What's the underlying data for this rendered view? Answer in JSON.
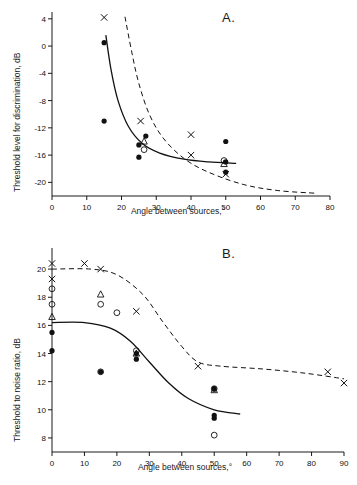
{
  "figure": {
    "panels": [
      {
        "label": "A."
      },
      {
        "label": "B."
      }
    ]
  },
  "chart_data": [
    {
      "type": "scatter",
      "panel": "A.",
      "title": "",
      "xlabel": "Angle between sources,°",
      "ylabel": "Threshold level for discrimination, dB",
      "xlim": [
        0,
        80
      ],
      "ylim": [
        -22,
        5
      ],
      "xticks": [
        0,
        10,
        20,
        30,
        40,
        50,
        60,
        70,
        80
      ],
      "yticks": [
        4,
        0,
        -4,
        -8,
        -12,
        -16,
        -20
      ],
      "xtick_labels": [
        "0",
        "10",
        "20",
        "30",
        "40",
        "50",
        "60",
        "70",
        "80"
      ],
      "ytick_labels": [
        "4",
        "0",
        "-4",
        "-8",
        "-12",
        "-16",
        "-20"
      ],
      "grid": false,
      "legend": "none",
      "series": [
        {
          "name": "filled circle",
          "marker": "filled-circle",
          "points": [
            {
              "x": 15.0,
              "y": 0.5
            },
            {
              "x": 15.0,
              "y": -11.0
            },
            {
              "x": 25.0,
              "y": -14.5
            },
            {
              "x": 25.0,
              "y": -16.3
            },
            {
              "x": 27.0,
              "y": -13.2
            },
            {
              "x": 50.0,
              "y": -14.0
            },
            {
              "x": 50.0,
              "y": -18.5
            },
            {
              "x": 50.0,
              "y": -17.0
            }
          ]
        },
        {
          "name": "open circle",
          "marker": "open-circle",
          "points": [
            {
              "x": 26.5,
              "y": -15.2
            },
            {
              "x": 49.5,
              "y": -16.8
            }
          ]
        },
        {
          "name": "open triangle",
          "marker": "open-triangle",
          "points": [
            {
              "x": 26.5,
              "y": -14.0
            },
            {
              "x": 49.5,
              "y": -17.3
            }
          ]
        },
        {
          "name": "cross",
          "marker": "cross",
          "points": [
            {
              "x": 15.0,
              "y": 4.2
            },
            {
              "x": 25.5,
              "y": -11.0
            },
            {
              "x": 40.0,
              "y": -16.0
            },
            {
              "x": 40.0,
              "y": -13.0
            },
            {
              "x": 50.0,
              "y": -18.8
            }
          ]
        }
      ],
      "curves": [
        {
          "name": "solid-curve",
          "style": "solid",
          "points": [
            {
              "x": 15.5,
              "y": 1.6
            },
            {
              "x": 17,
              "y": -3.5
            },
            {
              "x": 19,
              "y": -8.0
            },
            {
              "x": 22,
              "y": -11.8
            },
            {
              "x": 26,
              "y": -14.3
            },
            {
              "x": 31,
              "y": -15.7
            },
            {
              "x": 38,
              "y": -16.6
            },
            {
              "x": 45,
              "y": -17.0
            },
            {
              "x": 53,
              "y": -17.2
            }
          ]
        },
        {
          "name": "dashed-curve",
          "style": "dashed",
          "points": [
            {
              "x": 21,
              "y": 4.3
            },
            {
              "x": 23,
              "y": -1.0
            },
            {
              "x": 25,
              "y": -5.5
            },
            {
              "x": 28,
              "y": -10.0
            },
            {
              "x": 32,
              "y": -13.5
            },
            {
              "x": 38,
              "y": -16.5
            },
            {
              "x": 45,
              "y": -18.5
            },
            {
              "x": 55,
              "y": -20.3
            },
            {
              "x": 65,
              "y": -21.2
            },
            {
              "x": 76,
              "y": -21.6
            }
          ]
        }
      ]
    },
    {
      "type": "scatter",
      "panel": "B.",
      "title": "",
      "xlabel": "Angle between sources,°",
      "ylabel": "Threshold to noise ratio, dB",
      "xlim": [
        0,
        90
      ],
      "ylim": [
        7,
        21.5
      ],
      "xticks": [
        0,
        10,
        20,
        30,
        40,
        50,
        60,
        70,
        80,
        90
      ],
      "yticks": [
        20,
        18,
        16,
        14,
        12,
        10,
        8
      ],
      "xtick_labels": [
        "0",
        "10",
        "20",
        "30",
        "40",
        "50",
        "60",
        "70",
        "80",
        "90"
      ],
      "ytick_labels": [
        "20",
        "18",
        "16",
        "14",
        "12",
        "10",
        "8"
      ],
      "grid": false,
      "legend": "none",
      "series": [
        {
          "name": "filled circle",
          "marker": "filled-circle",
          "points": [
            {
              "x": 0.0,
              "y": 15.5
            },
            {
              "x": 0.0,
              "y": 14.2
            },
            {
              "x": 15.0,
              "y": 12.7
            },
            {
              "x": 26.0,
              "y": 14.0
            },
            {
              "x": 26.0,
              "y": 13.6
            },
            {
              "x": 50.0,
              "y": 11.5
            },
            {
              "x": 50.0,
              "y": 9.6
            },
            {
              "x": 50.0,
              "y": 9.4
            }
          ]
        },
        {
          "name": "open circle",
          "marker": "open-circle",
          "points": [
            {
              "x": 0.0,
              "y": 18.6
            },
            {
              "x": 0.0,
              "y": 17.5
            },
            {
              "x": 15.0,
              "y": 17.5
            },
            {
              "x": 20.0,
              "y": 16.9
            },
            {
              "x": 15.0,
              "y": 12.7
            },
            {
              "x": 26.0,
              "y": 14.2
            },
            {
              "x": 50.0,
              "y": 11.5
            },
            {
              "x": 50.0,
              "y": 8.2
            }
          ]
        },
        {
          "name": "open triangle",
          "marker": "open-triangle",
          "points": [
            {
              "x": 0.0,
              "y": 16.6
            },
            {
              "x": 15.0,
              "y": 18.2
            },
            {
              "x": 26.0,
              "y": 14.0
            },
            {
              "x": 50.0,
              "y": 11.4
            }
          ]
        },
        {
          "name": "cross",
          "marker": "cross",
          "points": [
            {
              "x": 0.0,
              "y": 20.4
            },
            {
              "x": 0.0,
              "y": 19.3
            },
            {
              "x": 10.0,
              "y": 20.4
            },
            {
              "x": 15.0,
              "y": 20.0
            },
            {
              "x": 26.0,
              "y": 17.0
            },
            {
              "x": 45.0,
              "y": 13.1
            },
            {
              "x": 85.0,
              "y": 12.7
            },
            {
              "x": 90.0,
              "y": 11.9
            }
          ]
        }
      ],
      "curves": [
        {
          "name": "solid-curve",
          "style": "solid",
          "points": [
            {
              "x": 0,
              "y": 16.2
            },
            {
              "x": 10,
              "y": 16.2
            },
            {
              "x": 18,
              "y": 15.8
            },
            {
              "x": 24,
              "y": 14.9
            },
            {
              "x": 30,
              "y": 13.4
            },
            {
              "x": 36,
              "y": 11.9
            },
            {
              "x": 42,
              "y": 10.8
            },
            {
              "x": 50,
              "y": 10.0
            },
            {
              "x": 58,
              "y": 9.7
            }
          ]
        },
        {
          "name": "dashed-curve",
          "style": "dashed",
          "points": [
            {
              "x": 0,
              "y": 20.0
            },
            {
              "x": 12,
              "y": 20.0
            },
            {
              "x": 20,
              "y": 19.6
            },
            {
              "x": 28,
              "y": 18.2
            },
            {
              "x": 34,
              "y": 16.3
            },
            {
              "x": 40,
              "y": 14.5
            },
            {
              "x": 45,
              "y": 13.4
            },
            {
              "x": 52,
              "y": 13.1
            },
            {
              "x": 65,
              "y": 12.9
            },
            {
              "x": 78,
              "y": 12.6
            },
            {
              "x": 90,
              "y": 12.2
            }
          ]
        }
      ]
    }
  ]
}
